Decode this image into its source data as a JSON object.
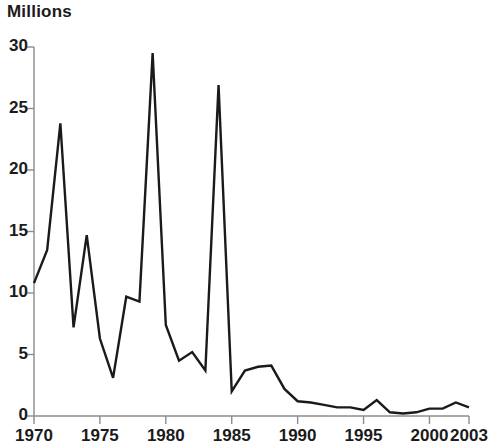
{
  "chart_data": {
    "type": "line",
    "title": "Millions",
    "xlabel": "",
    "ylabel": "Millions",
    "grid": false,
    "legend": null,
    "xlim": [
      1970,
      2003
    ],
    "ylim": [
      0,
      30
    ],
    "yticks": [
      0,
      5,
      10,
      15,
      20,
      25,
      30
    ],
    "ytick_labels": [
      "0",
      "5",
      "10",
      "15",
      "20",
      "25",
      "30"
    ],
    "xticks": [
      1970,
      1975,
      1980,
      1985,
      1990,
      1995,
      2000,
      2003
    ],
    "xtick_labels": [
      "1970",
      "1975",
      "1980",
      "1985",
      "1990",
      "1995",
      "2000",
      "2003"
    ],
    "x": [
      1970,
      1971,
      1972,
      1973,
      1974,
      1975,
      1976,
      1977,
      1978,
      1979,
      1980,
      1981,
      1982,
      1983,
      1984,
      1985,
      1986,
      1987,
      1988,
      1989,
      1990,
      1991,
      1992,
      1993,
      1994,
      1995,
      1996,
      1997,
      1998,
      1999,
      2000,
      2001,
      2002,
      2003
    ],
    "values": [
      10.8,
      13.5,
      23.8,
      7.2,
      14.7,
      6.3,
      3.1,
      9.7,
      9.3,
      29.5,
      7.4,
      4.5,
      5.2,
      3.7,
      26.9,
      2.0,
      3.7,
      4.0,
      4.1,
      2.2,
      1.2,
      1.1,
      0.9,
      0.7,
      0.7,
      0.5,
      1.3,
      0.3,
      0.2,
      0.3,
      0.6,
      0.6,
      1.1,
      0.7
    ],
    "series_color": "#1a1a1a",
    "axis_color": "#8c8c8c",
    "line_width": 2.4
  }
}
